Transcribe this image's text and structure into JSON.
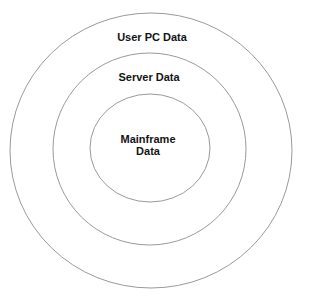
{
  "diagram": {
    "type": "concentric-circles",
    "line_color": "#9a9a9a",
    "text_color": "#141414",
    "rings": [
      {
        "id": "outer",
        "label": "User PC Data",
        "cx": 151,
        "cy": 150.5,
        "rx": 141,
        "ry": 137.5
      },
      {
        "id": "middle",
        "label": "Server Data",
        "cx": 149.5,
        "cy": 149,
        "rx": 96.5,
        "ry": 96
      },
      {
        "id": "inner",
        "label_line1": "Mainframe",
        "label_line2": "Data",
        "cx": 150,
        "cy": 148,
        "rx": 60,
        "ry": 54
      }
    ]
  }
}
